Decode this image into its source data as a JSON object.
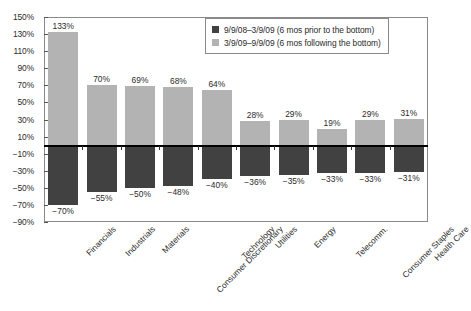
{
  "chart_data": {
    "type": "bar",
    "title": "",
    "subtitle": "",
    "xlabel": "",
    "ylabel": "",
    "ylim": [
      -90,
      150
    ],
    "ytick_labels": [
      "150%",
      "130%",
      "110%",
      "90%",
      "70%",
      "50%",
      "30%",
      "10%",
      "-10%",
      "-30%",
      "-50%",
      "-70%",
      "-90%"
    ],
    "ytick_values": [
      150,
      130,
      110,
      90,
      70,
      50,
      30,
      10,
      -10,
      -30,
      -50,
      -70,
      -90
    ],
    "grid": false,
    "legend_position": "top-right",
    "baseline": 0,
    "categories": [
      "Financials",
      "Industrials",
      "Materials",
      "Consumer Discretionary",
      "Technology",
      "Utilities",
      "Energy",
      "Telecomm.",
      "Consumer Staples",
      "Health Care"
    ],
    "series": [
      {
        "name": "9/9/08–3/9/09 (6 mos prior to the bottom)",
        "color": "#414141",
        "values": [
          -70,
          -55,
          -50,
          -48,
          -40,
          -36,
          -35,
          -33,
          -33,
          -31
        ],
        "labels": [
          "−70%",
          "−55%",
          "−50%",
          "−48%",
          "−40%",
          "−36%",
          "−35%",
          "−33%",
          "−33%",
          "−31%"
        ]
      },
      {
        "name": "3/9/09–9/9/09 (6 mos following the bottom)",
        "color": "#b3b3b3",
        "values": [
          133,
          70,
          69,
          68,
          64,
          28,
          29,
          19,
          29,
          31
        ],
        "labels": [
          "133%",
          "70%",
          "69%",
          "68%",
          "64%",
          "28%",
          "29%",
          "19%",
          "29%",
          "31%"
        ]
      }
    ]
  },
  "legend": {
    "items": [
      {
        "label": "9/9/08–3/9/09 (6 mos prior to the bottom)",
        "color": "#414141"
      },
      {
        "label": "3/9/09–9/9/09 (6 mos following the bottom)",
        "color": "#b3b3b3"
      }
    ]
  },
  "colors": {
    "series_dark": "#414141",
    "series_light": "#b3b3b3",
    "frame": "#8a8a8a",
    "baseline": "#000000",
    "text": "#2b2b2b",
    "background": "#ffffff"
  }
}
